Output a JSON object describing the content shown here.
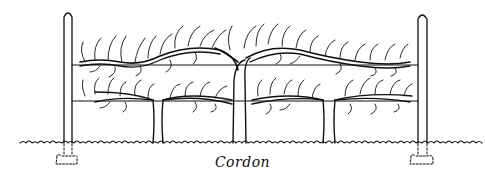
{
  "figure": {
    "caption": "Cordon",
    "elements": [
      "left-post",
      "right-post",
      "upper-wire",
      "lower-wire",
      "ground-line",
      "tree-left",
      "tree-center",
      "tree-right",
      "left-footing",
      "right-footing"
    ],
    "colors": {
      "ink": "#111111",
      "background": "#ffffff"
    }
  }
}
